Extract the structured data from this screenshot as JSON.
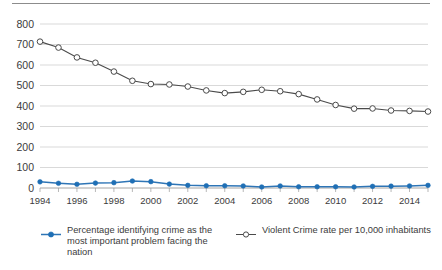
{
  "chart_data": {
    "type": "line",
    "title": "",
    "subtitle": "",
    "xlabel": "",
    "ylabel": "",
    "x": [
      1994,
      1995,
      1996,
      1997,
      1998,
      1999,
      2000,
      2001,
      2002,
      2003,
      2004,
      2005,
      2006,
      2007,
      2008,
      2009,
      2010,
      2011,
      2012,
      2013,
      2014,
      2015
    ],
    "xtick_labels": [
      "1994",
      "1996",
      "1998",
      "2000",
      "2002",
      "2004",
      "2006",
      "2008",
      "2010",
      "2012",
      "2014"
    ],
    "xtick_values": [
      1994,
      1996,
      1998,
      2000,
      2002,
      2004,
      2006,
      2008,
      2010,
      2012,
      2014
    ],
    "ytick_labels": [
      "0",
      "100",
      "200",
      "300",
      "400",
      "500",
      "600",
      "700",
      "800"
    ],
    "ytick_values": [
      0,
      100,
      200,
      300,
      400,
      500,
      600,
      700,
      800
    ],
    "ylim": [
      0,
      800
    ],
    "xlim": [
      1994,
      2015
    ],
    "grid": "horizontal",
    "legend_position": "bottom",
    "series": [
      {
        "name": "Percentage identifying crime as the most important problem facing the nation",
        "color": "#1F6FB5",
        "marker": "filled-circle",
        "values": [
          30,
          23,
          18,
          24,
          26,
          34,
          31,
          19,
          13,
          11,
          11,
          10,
          5,
          10,
          6,
          6,
          6,
          5,
          8,
          9,
          10,
          13
        ]
      },
      {
        "name": "Violent Crime rate per 10,000 inhabitants",
        "color": "#4A4A4A",
        "marker": "open-circle",
        "values": [
          714,
          685,
          637,
          611,
          568,
          523,
          507,
          505,
          495,
          476,
          463,
          469,
          479,
          472,
          458,
          432,
          405,
          387,
          388,
          378,
          376,
          373
        ]
      }
    ]
  },
  "legend": {
    "entries": [
      {
        "label": "Percentage identifying crime as the most important problem facing the nation",
        "marker": "filled-circle-marker"
      },
      {
        "label": "Violent Crime rate per 10,000 inhabitants",
        "marker": "open-circle-marker"
      }
    ]
  },
  "colors": {
    "blue_series": "#1F6FB5",
    "gray_series": "#4A4A4A",
    "gridline": "#C9C9C9",
    "text": "#3B3B3B"
  }
}
